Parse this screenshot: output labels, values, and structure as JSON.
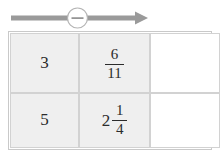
{
  "operator": {
    "symbol": "−",
    "name": "minus",
    "aria_label": "minus",
    "direction": "right",
    "line_color": "#9a9a9a",
    "circle_fill": "#ffffff",
    "circle_stroke": "#9a9a9a"
  },
  "table": {
    "columns": 3,
    "rows": 2,
    "border_color": "#d2d2d2",
    "filled_cell_color": "#efefef",
    "empty_cell_color": "#ffffff",
    "cells": [
      [
        {
          "kind": "integer",
          "text": "3",
          "whole": "3",
          "numerator": "",
          "denominator": "",
          "empty": false
        },
        {
          "kind": "fraction",
          "text": "6/11",
          "whole": "",
          "numerator": "6",
          "denominator": "11",
          "empty": false
        },
        {
          "kind": "empty",
          "text": "",
          "whole": "",
          "numerator": "",
          "denominator": "",
          "empty": true
        }
      ],
      [
        {
          "kind": "integer",
          "text": "5",
          "whole": "5",
          "numerator": "",
          "denominator": "",
          "empty": false
        },
        {
          "kind": "mixed",
          "text": "2 1/4",
          "whole": "2",
          "numerator": "1",
          "denominator": "4",
          "empty": false
        },
        {
          "kind": "empty",
          "text": "",
          "whole": "",
          "numerator": "",
          "denominator": "",
          "empty": true
        }
      ]
    ]
  }
}
